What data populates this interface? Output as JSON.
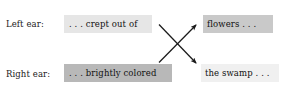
{
  "figure": {
    "background_color": "#ffffff",
    "width": 293,
    "height": 96
  },
  "rows": [
    {
      "id": "left-ear",
      "label": "Left ear:",
      "source_phrase": ". . . crept out of",
      "source_highlight_color": "#e6e6e6",
      "target_phrase": "flowers . . .",
      "target_highlight_color": "#c9c9c9"
    },
    {
      "id": "right-ear",
      "label": "Right ear:",
      "source_phrase": ". . . brightly colored",
      "source_highlight_color": "#b8b8b8",
      "target_phrase": "the swamp . . .",
      "target_highlight_color": "#f0f0f0"
    }
  ],
  "arrows": [
    {
      "id": "arrow-left-to-upper-right",
      "name": "arrow-up-right",
      "from": "right-ear-source",
      "to": "left-ear-target",
      "color": "#1a1a1a"
    },
    {
      "id": "arrow-left-to-lower-right",
      "name": "arrow-down-right",
      "from": "left-ear-source",
      "to": "right-ear-target",
      "color": "#1a1a1a"
    }
  ]
}
